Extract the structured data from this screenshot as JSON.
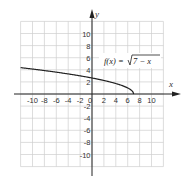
{
  "chart_data": {
    "type": "line",
    "title": "",
    "xlabel": "x",
    "ylabel": "y",
    "xlim": [
      -12,
      12
    ],
    "ylim": [
      -12,
      12
    ],
    "grid": true,
    "x_ticks": [
      -10,
      -8,
      -6,
      -4,
      -2,
      0,
      2,
      4,
      6,
      8,
      10
    ],
    "y_ticks": [
      10,
      8,
      6,
      4,
      2,
      -2,
      -4,
      -6,
      -8,
      -10
    ],
    "x_tick_labels": [
      "-10",
      "-8",
      "-6",
      "-4",
      "-2",
      "0",
      "2",
      "4",
      "6",
      "8",
      "10"
    ],
    "y_tick_labels": [
      "10",
      "8",
      "6",
      "4",
      "2",
      "-2",
      "-4",
      "-6",
      "-8",
      "-10"
    ],
    "annotations": [
      "f(x) = √(7 − x)"
    ],
    "series": [
      {
        "name": "f(x) = sqrt(7 - x)",
        "x": [
          -12,
          -10,
          -8,
          -6,
          -4,
          -2,
          0,
          2,
          4,
          5,
          6,
          6.5,
          7
        ],
        "values": [
          4.36,
          4.12,
          3.87,
          3.61,
          3.32,
          3.0,
          2.65,
          2.24,
          1.73,
          1.41,
          1.0,
          0.71,
          0
        ]
      }
    ]
  },
  "labels": {
    "x_axis": "x",
    "y_axis": "y",
    "function_prefix": "f(x) =",
    "function_radicand": "7 − x"
  }
}
